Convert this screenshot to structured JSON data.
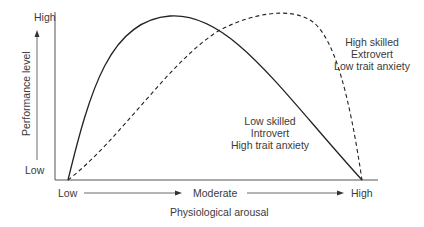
{
  "diagram": {
    "y_axis": {
      "label": "Performance level",
      "high": "High",
      "low": "Low"
    },
    "x_axis": {
      "label": "Physiological arousal",
      "low": "Low",
      "moderate": "Moderate",
      "high": "High"
    },
    "curves": [
      {
        "name": "Low skilled / Introvert / High trait anxiety",
        "style": "solid",
        "peak": "low-moderate arousal",
        "annotation": [
          "Low skilled",
          "Introvert",
          "High trait anxiety"
        ]
      },
      {
        "name": "High skilled / Extrovert / Low trait anxiety",
        "style": "dashed",
        "peak": "moderate-high arousal",
        "annotation": [
          "High skilled",
          "Extrovert",
          "Low trait anxiety"
        ]
      }
    ],
    "colors": {
      "line": "#222222",
      "text": "#3a3a3a"
    }
  }
}
